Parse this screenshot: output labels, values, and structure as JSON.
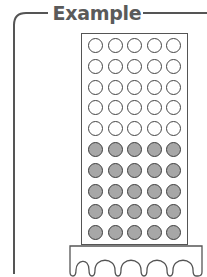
{
  "title": "Example",
  "colors": {
    "line": "#555555",
    "title_text": "#5a5a5a",
    "filled_circle": "#a7a7a7",
    "empty_circle": "#ffffff"
  },
  "frame": {
    "rows": 10,
    "columns": 5,
    "empty_rows": 5,
    "filled_rows": 5,
    "total_circles": 50,
    "empty_circles": 25,
    "filled_circles": 25
  },
  "base": {
    "arches": 5
  }
}
